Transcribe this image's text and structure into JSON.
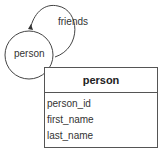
{
  "diagram": {
    "entity_node": {
      "label": "person"
    },
    "relationship": {
      "label": "friends"
    },
    "table": {
      "title": "person",
      "fields": [
        "person_id",
        "first_name",
        "last_name"
      ]
    }
  }
}
